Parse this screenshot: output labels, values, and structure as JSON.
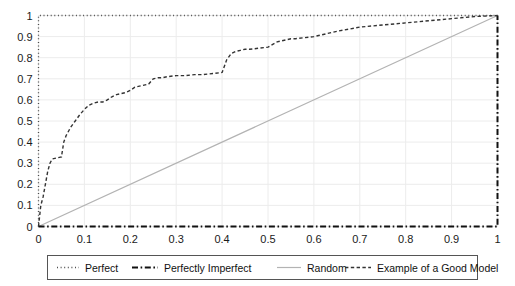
{
  "chart_data": {
    "type": "line",
    "title": "",
    "xlabel": "",
    "ylabel": "",
    "xlim": [
      0,
      1
    ],
    "ylim": [
      0,
      1
    ],
    "grid": true,
    "legend_position": "bottom",
    "xticks": [
      "0",
      "0.1",
      "0.2",
      "0.3",
      "0.4",
      "0.5",
      "0.6",
      "0.7",
      "0.8",
      "0.9",
      "1"
    ],
    "xtick_values": [
      0,
      0.1,
      0.2,
      0.3,
      0.4,
      0.5,
      0.6,
      0.7,
      0.8,
      0.9,
      1
    ],
    "yticks": [
      "0",
      "0.1",
      "0.2",
      "0.3",
      "0.4",
      "0.5",
      "0.6",
      "0.7",
      "0.8",
      "0.9",
      "1"
    ],
    "ytick_values": [
      0,
      0.1,
      0.2,
      0.3,
      0.4,
      0.5,
      0.6,
      0.7,
      0.8,
      0.9,
      1
    ],
    "series": [
      {
        "name": "Perfect",
        "style": "dotted",
        "color": "#4d4d4d",
        "x": [
          0,
          0,
          1
        ],
        "values": [
          0,
          1,
          1
        ]
      },
      {
        "name": "Perfectly Imperfect",
        "style": "dashdot",
        "color": "#111111",
        "x": [
          0,
          1,
          1
        ],
        "values": [
          0,
          0,
          1
        ]
      },
      {
        "name": "Random",
        "style": "solid",
        "color": "#b3b3b3",
        "x": [
          0,
          1
        ],
        "values": [
          0,
          1
        ]
      },
      {
        "name": "Example of a Good Model",
        "style": "dashed",
        "color": "#333333",
        "x": [
          0,
          0.005,
          0.01,
          0.015,
          0.02,
          0.025,
          0.03,
          0.04,
          0.05,
          0.055,
          0.06,
          0.07,
          0.08,
          0.09,
          0.1,
          0.11,
          0.12,
          0.13,
          0.14,
          0.15,
          0.16,
          0.17,
          0.18,
          0.19,
          0.2,
          0.21,
          0.22,
          0.23,
          0.24,
          0.25,
          0.26,
          0.27,
          0.28,
          0.3,
          0.32,
          0.34,
          0.36,
          0.38,
          0.4,
          0.41,
          0.42,
          0.43,
          0.44,
          0.45,
          0.46,
          0.48,
          0.5,
          0.52,
          0.54,
          0.55,
          0.56,
          0.58,
          0.6,
          0.65,
          0.7,
          0.75,
          0.8,
          0.85,
          0.9,
          0.95,
          1.0
        ],
        "values": [
          0,
          0.1,
          0.14,
          0.2,
          0.26,
          0.3,
          0.32,
          0.325,
          0.33,
          0.4,
          0.43,
          0.47,
          0.5,
          0.53,
          0.555,
          0.575,
          0.585,
          0.59,
          0.59,
          0.6,
          0.615,
          0.625,
          0.63,
          0.635,
          0.645,
          0.66,
          0.665,
          0.67,
          0.675,
          0.7,
          0.705,
          0.705,
          0.71,
          0.715,
          0.715,
          0.72,
          0.72,
          0.725,
          0.73,
          0.79,
          0.82,
          0.83,
          0.835,
          0.84,
          0.84,
          0.845,
          0.85,
          0.875,
          0.885,
          0.89,
          0.89,
          0.895,
          0.9,
          0.925,
          0.945,
          0.955,
          0.965,
          0.975,
          0.985,
          0.995,
          1.0
        ]
      }
    ]
  },
  "legend": {
    "items": [
      {
        "label": "Perfect",
        "style": "dotted"
      },
      {
        "label": "Perfectly Imperfect",
        "style": "dashdot"
      },
      {
        "label": "Random",
        "style": "solid"
      },
      {
        "label": "Example of a Good Model",
        "style": "dashed"
      }
    ]
  },
  "colors": {
    "grid": "#ececec",
    "axis_text": "#1a1a1a",
    "random_line": "#b3b3b3",
    "model_line": "#333333",
    "perfect_line": "#4d4d4d",
    "imperfect_line": "#111111",
    "legend_border": "#555555",
    "background": "#ffffff"
  }
}
